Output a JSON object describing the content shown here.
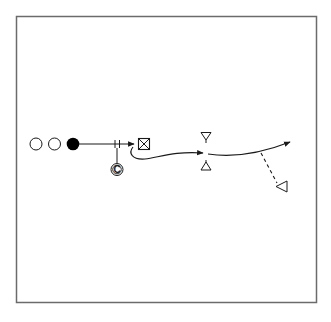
{
  "diagram": {
    "type": "sports-drill",
    "field": {
      "stroke": "#6b6b6b",
      "background": "#ffffff"
    },
    "colors": {
      "ink": "#1a1a1a",
      "player_filled": "#000000",
      "player_empty": "#ffffff"
    },
    "players": [
      {
        "id": "waiting-player-1",
        "kind": "empty-circle"
      },
      {
        "id": "waiting-player-2",
        "kind": "empty-circle"
      },
      {
        "id": "active-player",
        "kind": "filled-circle"
      }
    ],
    "coach": {
      "label": "C"
    },
    "target": {
      "kind": "crossed-box"
    },
    "cones": [
      {
        "id": "cone-top",
        "kind": "triangle-down"
      },
      {
        "id": "cone-bottom",
        "kind": "triangle-up"
      },
      {
        "id": "cone-right",
        "kind": "triangle-left"
      }
    ],
    "paths": [
      {
        "id": "pass-line",
        "style": "solid",
        "arrow": true
      },
      {
        "id": "dribble-run",
        "style": "solid-curved",
        "arrow": true
      },
      {
        "id": "follow-run",
        "style": "solid-curved",
        "arrow": true
      },
      {
        "id": "dashed-pass",
        "style": "dashed",
        "arrow": false
      }
    ]
  }
}
